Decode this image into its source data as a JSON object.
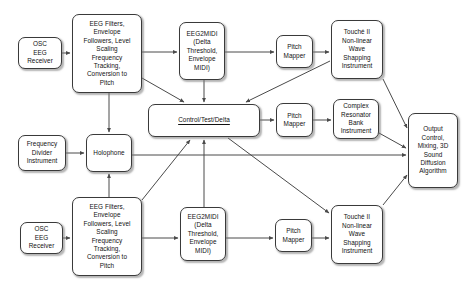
{
  "diagram": {
    "canvas": {
      "width": 467,
      "height": 291
    },
    "style": {
      "node_fill": "#ffffff",
      "node_stroke": "#3a3a3a",
      "edge_stroke": "#4a4a4a",
      "text_color": "#111111",
      "background": "#ffffff"
    },
    "nodes": [
      {
        "id": "osc-eeg-receiver-top",
        "label": "OSC\nEEG\nReceiver",
        "x": 18,
        "y": 37,
        "w": 44,
        "h": 32
      },
      {
        "id": "eeg-filters-top",
        "label": "EEG Filters,\nEnvelope\nFollowers, Level\nScaling\nFrequency\nTracking,\nConversion to\nPitch",
        "x": 72,
        "y": 14,
        "w": 70,
        "h": 79
      },
      {
        "id": "eeg2midi-top",
        "label": "EEG2MIDI\n(Delta\nThreshold,\nEnvelope\nMIDI)",
        "x": 179,
        "y": 22,
        "w": 46,
        "h": 58
      },
      {
        "id": "pitch-mapper-top",
        "label": "Pitch\nMapper",
        "x": 276,
        "y": 35,
        "w": 37,
        "h": 33
      },
      {
        "id": "touche-top",
        "label": "Touché II\nNon-linear\nWave\nShapping\nInstrument",
        "x": 331,
        "y": 20,
        "w": 52,
        "h": 59
      },
      {
        "id": "control-test-delta",
        "label": "Control/Test/Delta",
        "x": 148,
        "y": 104,
        "w": 112,
        "h": 33,
        "emphasis": "underline"
      },
      {
        "id": "pitch-mapper-middle",
        "label": "Pitch\nMapper",
        "x": 276,
        "y": 103,
        "w": 37,
        "h": 34
      },
      {
        "id": "complex-resonator-bank",
        "label": "Complex\nResonator\nBank\nInstrument",
        "x": 333,
        "y": 99,
        "w": 46,
        "h": 40
      },
      {
        "id": "output-control",
        "label": "Output\nControl,\nMixing, 3D\nSound\nDiffusion\nAlgorithm",
        "x": 408,
        "y": 113,
        "w": 50,
        "h": 75
      },
      {
        "id": "frequency-divider-instrument",
        "label": "Frequency\nDivider\nInstrument",
        "x": 18,
        "y": 135,
        "w": 48,
        "h": 36
      },
      {
        "id": "holophone",
        "label": "Holophone",
        "x": 86,
        "y": 134,
        "w": 46,
        "h": 38
      },
      {
        "id": "osc-eeg-receiver-bottom",
        "label": "OSC\nEEG\nReceiver",
        "x": 20,
        "y": 222,
        "w": 43,
        "h": 32
      },
      {
        "id": "eeg-filters-bottom",
        "label": "EEG Filters,\nEnvelope\nFollowers, Level\nScaling\nFrequency\nTracking,\nConversion to\nPitch",
        "x": 72,
        "y": 197,
        "w": 70,
        "h": 79
      },
      {
        "id": "eeg2midi-bottom",
        "label": "EEG2MIDI\n(Delta\nThreshold,\nEnvelope\nMIDI)",
        "x": 180,
        "y": 207,
        "w": 46,
        "h": 54
      },
      {
        "id": "pitch-mapper-bottom",
        "label": "Pitch\nMapper",
        "x": 275,
        "y": 219,
        "w": 37,
        "h": 33
      },
      {
        "id": "touche-bottom",
        "label": "Touché II\nNon-linear\nWave\nShapping\nInstrument",
        "x": 331,
        "y": 205,
        "w": 52,
        "h": 59
      }
    ],
    "edges": [
      {
        "id": "e1",
        "from": "osc-eeg-receiver-top",
        "to": "eeg-filters-top",
        "x1": 62,
        "y1": 53,
        "x2": 70,
        "y2": 53
      },
      {
        "id": "e2",
        "from": "eeg-filters-top",
        "to": "eeg2midi-top",
        "x1": 142,
        "y1": 52,
        "x2": 177,
        "y2": 52
      },
      {
        "id": "e3",
        "from": "eeg2midi-top",
        "to": "pitch-mapper-top",
        "x1": 225,
        "y1": 52,
        "x2": 274,
        "y2": 52
      },
      {
        "id": "e4",
        "from": "pitch-mapper-top",
        "to": "touche-top",
        "x1": 313,
        "y1": 52,
        "x2": 329,
        "y2": 52
      },
      {
        "id": "e5",
        "from": "eeg-filters-top",
        "to": "holophone",
        "x1": 109,
        "y1": 93,
        "x2": 109,
        "y2": 132
      },
      {
        "id": "e6",
        "from": "eeg-filters-top",
        "to": "control-test-delta",
        "x1": 142,
        "y1": 78,
        "x2": 184,
        "y2": 102
      },
      {
        "id": "e7",
        "from": "eeg2midi-top",
        "to": "control-test-delta",
        "x1": 204,
        "y1": 80,
        "x2": 204,
        "y2": 102
      },
      {
        "id": "e8",
        "from": "touche-top",
        "to": "control-test-delta",
        "x1": 330,
        "y1": 61,
        "x2": 246,
        "y2": 102
      },
      {
        "id": "e9",
        "from": "control-test-delta",
        "to": "pitch-mapper-middle",
        "x1": 260,
        "y1": 120,
        "x2": 274,
        "y2": 120
      },
      {
        "id": "e10",
        "from": "pitch-mapper-middle",
        "to": "complex-resonator-bank",
        "x1": 313,
        "y1": 120,
        "x2": 331,
        "y2": 120
      },
      {
        "id": "e11",
        "from": "touche-top",
        "to": "output-control",
        "x1": 383,
        "y1": 79,
        "x2": 407,
        "y2": 128
      },
      {
        "id": "e12",
        "from": "complex-resonator-bank",
        "to": "output-control",
        "x1": 379,
        "y1": 133,
        "x2": 406,
        "y2": 148
      },
      {
        "id": "e13",
        "from": "frequency-divider-instrument",
        "to": "holophone",
        "x1": 66,
        "y1": 153,
        "x2": 84,
        "y2": 153
      },
      {
        "id": "e14",
        "from": "holophone",
        "to": "output-control",
        "x1": 132,
        "y1": 155,
        "x2": 406,
        "y2": 155
      },
      {
        "id": "e15",
        "from": "eeg-filters-bottom",
        "to": "holophone",
        "x1": 109,
        "y1": 197,
        "x2": 109,
        "y2": 174
      },
      {
        "id": "e16",
        "from": "osc-eeg-receiver-bottom",
        "to": "eeg-filters-bottom",
        "x1": 63,
        "y1": 238,
        "x2": 70,
        "y2": 238
      },
      {
        "id": "e17",
        "from": "eeg-filters-bottom",
        "to": "eeg2midi-bottom",
        "x1": 142,
        "y1": 238,
        "x2": 178,
        "y2": 238
      },
      {
        "id": "e18",
        "from": "eeg2midi-bottom",
        "to": "pitch-mapper-bottom",
        "x1": 226,
        "y1": 238,
        "x2": 273,
        "y2": 238
      },
      {
        "id": "e19",
        "from": "pitch-mapper-bottom",
        "to": "touche-bottom",
        "x1": 312,
        "y1": 238,
        "x2": 329,
        "y2": 238
      },
      {
        "id": "e20",
        "from": "eeg-filters-bottom",
        "to": "control-test-delta",
        "x1": 142,
        "y1": 200,
        "x2": 190,
        "y2": 140
      },
      {
        "id": "e21",
        "from": "eeg2midi-bottom",
        "to": "control-test-delta",
        "x1": 204,
        "y1": 207,
        "x2": 204,
        "y2": 140
      },
      {
        "id": "e22",
        "from": "control-test-delta",
        "to": "touche-bottom",
        "x1": 228,
        "y1": 138,
        "x2": 329,
        "y2": 213
      },
      {
        "id": "e23",
        "from": "touche-bottom",
        "to": "output-control",
        "x1": 383,
        "y1": 205,
        "x2": 407,
        "y2": 175
      }
    ]
  }
}
